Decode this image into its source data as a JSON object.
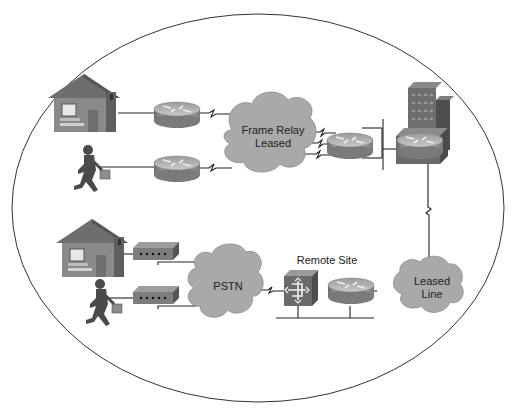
{
  "diagram": {
    "boundary": "oval",
    "colors": {
      "cloud_fill": "#a9a9a9",
      "router_top": "#c8c8c8",
      "router_side": "#8e8e8e",
      "house_wall": "#8a8a8a",
      "house_roof": "#6e6e6e",
      "person": "#4a4a4a",
      "line": "#222222",
      "building": "#6f6f6f"
    },
    "clouds": [
      {
        "id": "frame-relay",
        "line1": "Frame Relay",
        "line2": "Leased"
      },
      {
        "id": "pstn",
        "line1": "PSTN",
        "line2": ""
      },
      {
        "id": "leased-line",
        "line1": "Leased",
        "line2": "Line"
      }
    ],
    "labels": {
      "remote_site": "Remote Site"
    },
    "nodes": [
      {
        "type": "house",
        "position": "top-left"
      },
      {
        "type": "mobile-user",
        "position": "upper-left"
      },
      {
        "type": "router",
        "position": "top-house-router"
      },
      {
        "type": "router",
        "position": "mobile-user-router"
      },
      {
        "type": "router",
        "position": "frame-relay-hub-router"
      },
      {
        "type": "headquarters-building-router",
        "position": "top-right"
      },
      {
        "type": "house",
        "position": "lower-left"
      },
      {
        "type": "mobile-user",
        "position": "lower-left"
      },
      {
        "type": "modem",
        "position": "house-modem"
      },
      {
        "type": "modem",
        "position": "user-modem"
      },
      {
        "type": "access-server",
        "position": "remote-site"
      },
      {
        "type": "router",
        "position": "remote-site"
      }
    ]
  }
}
